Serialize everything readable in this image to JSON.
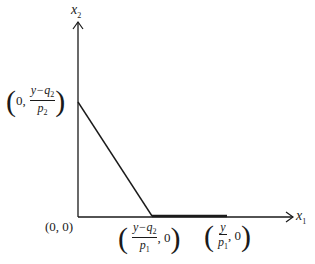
{
  "diagram": {
    "axes": {
      "x_label": "x",
      "x_label_sub": "1",
      "y_label": "x",
      "y_label_sub": "2"
    },
    "points": {
      "origin": "(0, 0)",
      "y_intercept": {
        "prefix": "0,",
        "numerator": "y−q",
        "numerator_sub": "2",
        "denominator": "p",
        "denominator_sub": "2"
      },
      "kink": {
        "numerator": "y−q",
        "numerator_sub": "2",
        "denominator": "p",
        "denominator_sub": "1",
        "suffix": ", 0"
      },
      "x_end": {
        "numerator": "y",
        "denominator": "p",
        "denominator_sub": "1",
        "suffix": ", 0"
      }
    },
    "colors": {
      "line": "#1a1a1a",
      "background": "#ffffff"
    }
  }
}
